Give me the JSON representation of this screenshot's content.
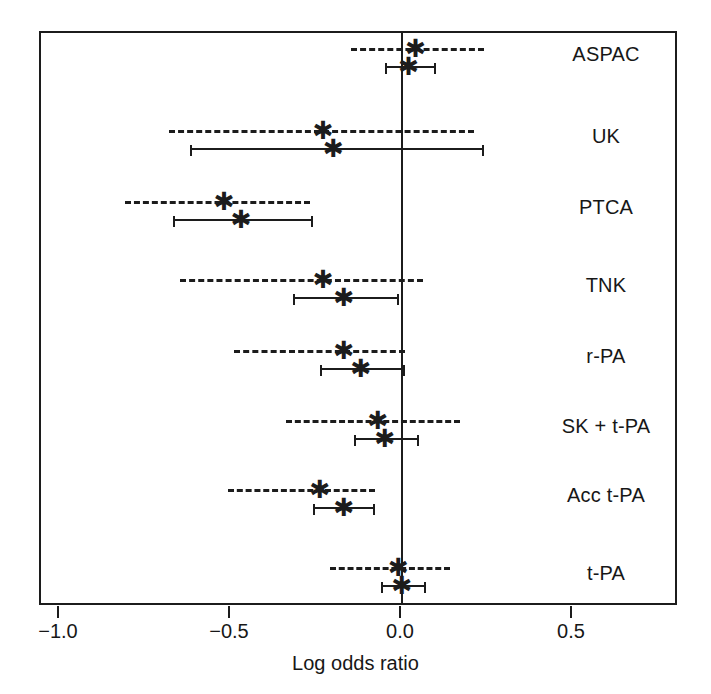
{
  "chart_data": {
    "type": "scatter",
    "title": "",
    "xlabel": "Log odds ratio",
    "ylabel": "",
    "xlim": [
      -1.15,
      0.81
    ],
    "xticks": [
      -1.0,
      -0.5,
      0.0,
      0.5
    ],
    "xticklabels": [
      "−1.0",
      "−0.5",
      "0.0",
      "0.5"
    ],
    "grid": false,
    "legend": "none",
    "reference_line": 0.0,
    "marker": "asterisk",
    "categories": [
      "ASPAC",
      "UK",
      "PTCA",
      "TNK",
      "r-PA",
      "SK + t-PA",
      "Acc t-PA",
      "t-PA"
    ],
    "series": [
      {
        "name": "random-effects interval",
        "style": "dashed",
        "values": [
          0.04,
          -0.23,
          -0.52,
          -0.23,
          -0.17,
          -0.07,
          -0.24,
          -0.01
        ]
      },
      {
        "name": "fixed-effect interval",
        "style": "solid",
        "values": [
          0.02,
          -0.2,
          -0.47,
          -0.17,
          -0.12,
          -0.05,
          -0.17,
          0.0
        ]
      }
    ],
    "rows": [
      {
        "label": "ASPAC",
        "dashed": {
          "estimate": 0.04,
          "low": -0.15,
          "high": 0.24
        },
        "solid": {
          "estimate": 0.02,
          "low": -0.05,
          "high": 0.1
        }
      },
      {
        "label": "UK",
        "dashed": {
          "estimate": -0.23,
          "low": -0.68,
          "high": 0.21
        },
        "solid": {
          "estimate": -0.2,
          "low": -0.62,
          "high": 0.24
        }
      },
      {
        "label": "PTCA",
        "dashed": {
          "estimate": -0.52,
          "low": -0.81,
          "high": -0.27
        },
        "solid": {
          "estimate": -0.47,
          "low": -0.67,
          "high": -0.26
        }
      },
      {
        "label": "TNK",
        "dashed": {
          "estimate": -0.23,
          "low": -0.65,
          "high": 0.06
        },
        "solid": {
          "estimate": -0.17,
          "low": -0.32,
          "high": -0.01
        }
      },
      {
        "label": "r-PA",
        "dashed": {
          "estimate": -0.17,
          "low": -0.49,
          "high": 0.01
        },
        "solid": {
          "estimate": -0.12,
          "low": -0.24,
          "high": 0.01
        }
      },
      {
        "label": "SK + t-PA",
        "dashed": {
          "estimate": -0.07,
          "low": -0.34,
          "high": 0.17
        },
        "solid": {
          "estimate": -0.05,
          "low": -0.14,
          "high": 0.05
        }
      },
      {
        "label": "Acc t-PA",
        "dashed": {
          "estimate": -0.24,
          "low": -0.51,
          "high": -0.08
        },
        "solid": {
          "estimate": -0.17,
          "low": -0.26,
          "high": -0.08
        }
      },
      {
        "label": "t-PA",
        "dashed": {
          "estimate": -0.01,
          "low": -0.21,
          "high": 0.14
        },
        "solid": {
          "estimate": 0.0,
          "low": -0.06,
          "high": 0.07
        }
      }
    ]
  },
  "axis": {
    "title": "Log odds ratio",
    "ticks": [
      {
        "value": -1.0,
        "label": "−1.0"
      },
      {
        "value": -0.5,
        "label": "−0.5"
      },
      {
        "value": 0.0,
        "label": "0.0"
      },
      {
        "value": 0.5,
        "label": "0.5"
      }
    ]
  },
  "style": {
    "ink": "#1c1c1c",
    "background": "#ffffff",
    "marker_glyph": "✱"
  }
}
